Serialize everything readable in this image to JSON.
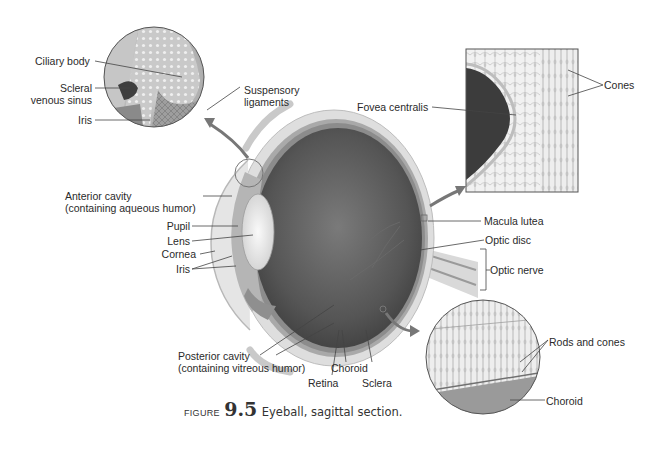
{
  "figure": {
    "caption_prefix": "FIGURE",
    "caption_number": "9.5",
    "caption_text": "Eyeball, sagittal section."
  },
  "labels": {
    "ciliary_body": "Ciliary body",
    "scleral_venous_sinus_1": "Scleral",
    "scleral_venous_sinus_2": "venous sinus",
    "iris_inset": "Iris",
    "suspensory_1": "Suspensory",
    "suspensory_2": "ligaments",
    "anterior_cavity_1": "Anterior cavity",
    "anterior_cavity_2": "(containing aqueous humor)",
    "pupil": "Pupil",
    "lens": "Lens",
    "cornea": "Cornea",
    "iris": "Iris",
    "posterior_cavity_1": "Posterior cavity",
    "posterior_cavity_2": "(containing vitreous humor)",
    "retina": "Retina",
    "choroid": "Choroid",
    "sclera": "Sclera",
    "fovea_centralis": "Fovea centralis",
    "cones": "Cones",
    "macula_lutea": "Macula lutea",
    "optic_disc": "Optic disc",
    "optic_nerve": "Optic nerve",
    "rods_and_cones": "Rods and cones",
    "choroid_inset": "Choroid"
  },
  "colors": {
    "background": "#ffffff",
    "vitreous": "#5a5a5a",
    "sclera": "#d8d8d8",
    "lens": "#eeeeee",
    "fovea_dark": "#3c3c3c",
    "leader": "#444444"
  }
}
